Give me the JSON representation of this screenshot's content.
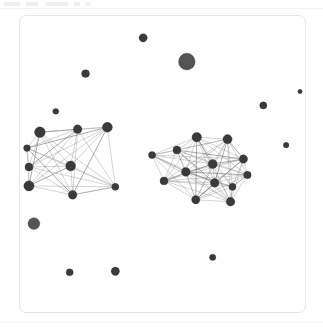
{
  "figure": {
    "title": "",
    "panel_label": "",
    "background_color": "#ffffff",
    "panel_border_color": "#e6e6e6",
    "node_color": "#3a3a3a",
    "edge_color": "#8c8c8c"
  },
  "top_ticks": [
    {
      "left": 2,
      "width": 16
    },
    {
      "left": 24,
      "width": 12
    },
    {
      "left": 44,
      "width": 22
    },
    {
      "left": 72,
      "width": 6
    },
    {
      "left": 84,
      "width": 4
    }
  ],
  "chart_data": {
    "type": "scatter",
    "title": "",
    "xlabel": "",
    "ylabel": "",
    "xlim": [
      0,
      287
    ],
    "ylim": [
      0,
      298
    ],
    "grid": false,
    "legend": null,
    "node_count": 32,
    "edge_count": 164,
    "cluster_count": 2,
    "isolated_node_count": 11,
    "nodes": [
      {
        "id": "n1",
        "x": 124,
        "y": 22,
        "r": 4.2,
        "cluster": "isolated",
        "label": ""
      },
      {
        "id": "n2",
        "x": 168,
        "y": 46,
        "r": 8.4,
        "cluster": "isolated",
        "label": ""
      },
      {
        "id": "n3",
        "x": 66,
        "y": 58,
        "r": 4.0,
        "cluster": "isolated",
        "label": ""
      },
      {
        "id": "n4",
        "x": 36,
        "y": 96,
        "r": 3.0,
        "cluster": "isolated",
        "label": ""
      },
      {
        "id": "n5",
        "x": 245,
        "y": 90,
        "r": 3.6,
        "cluster": "isolated",
        "label": ""
      },
      {
        "id": "n6",
        "x": 268,
        "y": 130,
        "r": 2.8,
        "cluster": "isolated",
        "label": ""
      },
      {
        "id": "n7",
        "x": 14,
        "y": 209,
        "r": 6.0,
        "cluster": "isolated",
        "label": ""
      },
      {
        "id": "n8",
        "x": 194,
        "y": 243,
        "r": 3.2,
        "cluster": "isolated",
        "label": ""
      },
      {
        "id": "n9",
        "x": 50,
        "y": 258,
        "r": 3.6,
        "cluster": "isolated",
        "label": ""
      },
      {
        "id": "n10",
        "x": 96,
        "y": 257,
        "r": 4.2,
        "cluster": "isolated",
        "label": ""
      },
      {
        "id": "n11",
        "x": 282,
        "y": 76,
        "r": 2.2,
        "cluster": "isolated",
        "label": ""
      },
      {
        "id": "L1",
        "x": 20,
        "y": 117,
        "r": 5.4,
        "cluster": "left",
        "label": ""
      },
      {
        "id": "L2",
        "x": 58,
        "y": 114,
        "r": 4.4,
        "cluster": "left",
        "label": ""
      },
      {
        "id": "L3",
        "x": 88,
        "y": 112,
        "r": 5.0,
        "cluster": "left",
        "label": ""
      },
      {
        "id": "L4",
        "x": 7,
        "y": 133,
        "r": 3.4,
        "cluster": "left",
        "label": ""
      },
      {
        "id": "L5",
        "x": 9,
        "y": 152,
        "r": 4.0,
        "cluster": "left",
        "label": ""
      },
      {
        "id": "L6",
        "x": 51,
        "y": 151,
        "r": 5.0,
        "cluster": "left",
        "label": ""
      },
      {
        "id": "L7",
        "x": 9,
        "y": 171,
        "r": 5.2,
        "cluster": "left",
        "label": ""
      },
      {
        "id": "L8",
        "x": 96,
        "y": 172,
        "r": 3.6,
        "cluster": "left",
        "label": ""
      },
      {
        "id": "L9",
        "x": 53,
        "y": 180,
        "r": 4.4,
        "cluster": "left",
        "label": ""
      },
      {
        "id": "R1",
        "x": 178,
        "y": 122,
        "r": 4.8,
        "cluster": "right",
        "label": ""
      },
      {
        "id": "R2",
        "x": 209,
        "y": 124,
        "r": 4.6,
        "cluster": "right",
        "label": ""
      },
      {
        "id": "R3",
        "x": 158,
        "y": 135,
        "r": 4.0,
        "cluster": "right",
        "label": ""
      },
      {
        "id": "R4",
        "x": 133,
        "y": 140,
        "r": 3.6,
        "cluster": "right",
        "label": ""
      },
      {
        "id": "R5",
        "x": 225,
        "y": 144,
        "r": 4.2,
        "cluster": "right",
        "label": ""
      },
      {
        "id": "R6",
        "x": 194,
        "y": 149,
        "r": 4.6,
        "cluster": "right",
        "label": ""
      },
      {
        "id": "R7",
        "x": 167,
        "y": 157,
        "r": 4.4,
        "cluster": "right",
        "label": ""
      },
      {
        "id": "R8",
        "x": 229,
        "y": 160,
        "r": 3.8,
        "cluster": "right",
        "label": ""
      },
      {
        "id": "R9",
        "x": 145,
        "y": 166,
        "r": 4.0,
        "cluster": "right",
        "label": ""
      },
      {
        "id": "R10",
        "x": 196,
        "y": 168,
        "r": 4.4,
        "cluster": "right",
        "label": ""
      },
      {
        "id": "R11",
        "x": 177,
        "y": 185,
        "r": 4.2,
        "cluster": "right",
        "label": ""
      },
      {
        "id": "R12",
        "x": 212,
        "y": 187,
        "r": 4.4,
        "cluster": "right",
        "label": ""
      },
      {
        "id": "R13",
        "x": 214,
        "y": 172,
        "r": 3.6,
        "cluster": "right",
        "label": ""
      }
    ],
    "edges": [
      [
        "L1",
        "L2"
      ],
      [
        "L1",
        "L3"
      ],
      [
        "L1",
        "L4"
      ],
      [
        "L1",
        "L5"
      ],
      [
        "L1",
        "L6"
      ],
      [
        "L1",
        "L7"
      ],
      [
        "L1",
        "L8"
      ],
      [
        "L1",
        "L9"
      ],
      [
        "L2",
        "L3"
      ],
      [
        "L2",
        "L4"
      ],
      [
        "L2",
        "L5"
      ],
      [
        "L2",
        "L6"
      ],
      [
        "L2",
        "L7"
      ],
      [
        "L2",
        "L8"
      ],
      [
        "L2",
        "L9"
      ],
      [
        "L3",
        "L4"
      ],
      [
        "L3",
        "L5"
      ],
      [
        "L3",
        "L6"
      ],
      [
        "L3",
        "L7"
      ],
      [
        "L3",
        "L8"
      ],
      [
        "L3",
        "L9"
      ],
      [
        "L4",
        "L5"
      ],
      [
        "L4",
        "L6"
      ],
      [
        "L4",
        "L7"
      ],
      [
        "L4",
        "L8"
      ],
      [
        "L4",
        "L9"
      ],
      [
        "L5",
        "L6"
      ],
      [
        "L5",
        "L7"
      ],
      [
        "L5",
        "L8"
      ],
      [
        "L5",
        "L9"
      ],
      [
        "L6",
        "L7"
      ],
      [
        "L6",
        "L8"
      ],
      [
        "L6",
        "L9"
      ],
      [
        "L7",
        "L8"
      ],
      [
        "L7",
        "L9"
      ],
      [
        "L8",
        "L9"
      ],
      [
        "R1",
        "R2"
      ],
      [
        "R1",
        "R3"
      ],
      [
        "R1",
        "R4"
      ],
      [
        "R1",
        "R5"
      ],
      [
        "R1",
        "R6"
      ],
      [
        "R1",
        "R7"
      ],
      [
        "R1",
        "R8"
      ],
      [
        "R1",
        "R9"
      ],
      [
        "R1",
        "R10"
      ],
      [
        "R1",
        "R11"
      ],
      [
        "R1",
        "R12"
      ],
      [
        "R1",
        "R13"
      ],
      [
        "R2",
        "R3"
      ],
      [
        "R2",
        "R4"
      ],
      [
        "R2",
        "R5"
      ],
      [
        "R2",
        "R6"
      ],
      [
        "R2",
        "R7"
      ],
      [
        "R2",
        "R8"
      ],
      [
        "R2",
        "R9"
      ],
      [
        "R2",
        "R10"
      ],
      [
        "R2",
        "R11"
      ],
      [
        "R2",
        "R12"
      ],
      [
        "R2",
        "R13"
      ],
      [
        "R3",
        "R4"
      ],
      [
        "R3",
        "R5"
      ],
      [
        "R3",
        "R6"
      ],
      [
        "R3",
        "R7"
      ],
      [
        "R3",
        "R8"
      ],
      [
        "R3",
        "R9"
      ],
      [
        "R3",
        "R10"
      ],
      [
        "R3",
        "R11"
      ],
      [
        "R3",
        "R12"
      ],
      [
        "R4",
        "R5"
      ],
      [
        "R4",
        "R6"
      ],
      [
        "R4",
        "R7"
      ],
      [
        "R4",
        "R9"
      ],
      [
        "R4",
        "R10"
      ],
      [
        "R4",
        "R11"
      ],
      [
        "R4",
        "R12"
      ],
      [
        "R5",
        "R6"
      ],
      [
        "R5",
        "R7"
      ],
      [
        "R5",
        "R8"
      ],
      [
        "R5",
        "R9"
      ],
      [
        "R5",
        "R10"
      ],
      [
        "R5",
        "R11"
      ],
      [
        "R5",
        "R12"
      ],
      [
        "R5",
        "R13"
      ],
      [
        "R6",
        "R7"
      ],
      [
        "R6",
        "R8"
      ],
      [
        "R6",
        "R9"
      ],
      [
        "R6",
        "R10"
      ],
      [
        "R6",
        "R11"
      ],
      [
        "R6",
        "R12"
      ],
      [
        "R6",
        "R13"
      ],
      [
        "R7",
        "R8"
      ],
      [
        "R7",
        "R9"
      ],
      [
        "R7",
        "R10"
      ],
      [
        "R7",
        "R11"
      ],
      [
        "R7",
        "R12"
      ],
      [
        "R7",
        "R13"
      ],
      [
        "R8",
        "R9"
      ],
      [
        "R8",
        "R10"
      ],
      [
        "R8",
        "R11"
      ],
      [
        "R8",
        "R12"
      ],
      [
        "R8",
        "R13"
      ],
      [
        "R9",
        "R10"
      ],
      [
        "R9",
        "R11"
      ],
      [
        "R9",
        "R12"
      ],
      [
        "R9",
        "R13"
      ],
      [
        "R10",
        "R11"
      ],
      [
        "R10",
        "R12"
      ],
      [
        "R10",
        "R13"
      ],
      [
        "R11",
        "R12"
      ],
      [
        "R11",
        "R13"
      ],
      [
        "R12",
        "R13"
      ]
    ]
  }
}
